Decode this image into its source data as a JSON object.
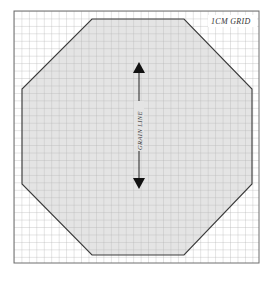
{
  "diagram": {
    "type": "sewing-pattern-piece",
    "shape": "octagon",
    "grid_label": "1cm grid",
    "grain_label": "GRAIN LINE",
    "colors": {
      "background": "#ffffff",
      "grid_line": "#b5b5b5",
      "border": "#6e6e6e",
      "shape_fill": "#e4e4e4",
      "shape_stroke": "#3a3a3a",
      "arrow": "#111111"
    }
  }
}
